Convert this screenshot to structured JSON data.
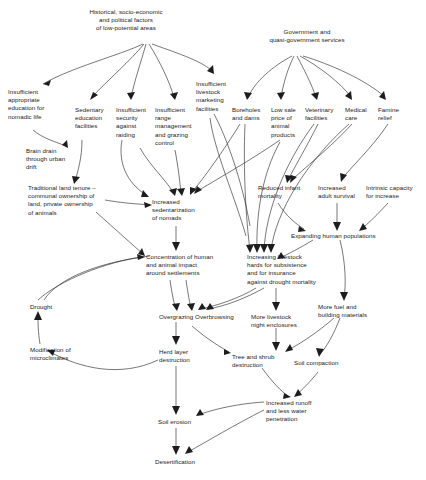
{
  "diagram": {
    "type": "flowchart",
    "stroke_color": "#1d1d1d",
    "text_color": "#1a1a1a",
    "background": "#ffffff",
    "nodes": [
      {
        "id": "historical",
        "label": "Historical, socio-economic\nand political factors\nof low-potential areas",
        "x": 70,
        "y": 8,
        "w": 112,
        "align": "center"
      },
      {
        "id": "government",
        "label": "Government and\nquasi-government services",
        "x": 252,
        "y": 28,
        "w": 110,
        "align": "center"
      },
      {
        "id": "education",
        "label": "Insufficient\nappropriate\neducation for\nnomadic life",
        "x": 8,
        "y": 88,
        "w": 52,
        "align": "left"
      },
      {
        "id": "sedentary-ed",
        "label": "Sedentary\neducation\nfacilities",
        "x": 75,
        "y": 106,
        "w": 40,
        "align": "left"
      },
      {
        "id": "security",
        "label": "Insufficient\nsecurity\nagainst\nraiding",
        "x": 116,
        "y": 106,
        "w": 38,
        "align": "left"
      },
      {
        "id": "range-mgmt",
        "label": "Insufficient\nrange\nmanagement\nand grazing\ncontrol",
        "x": 155,
        "y": 106,
        "w": 44,
        "align": "left"
      },
      {
        "id": "marketing",
        "label": "Insufficient\nlivestock\nmarketing\nfacilities",
        "x": 196,
        "y": 80,
        "w": 38,
        "align": "left"
      },
      {
        "id": "boreholes",
        "label": "Boreholes\nand dams",
        "x": 232,
        "y": 106,
        "w": 36,
        "align": "left"
      },
      {
        "id": "low-sale",
        "label": "Low sale\nprice of\nanimal\nproducts",
        "x": 271,
        "y": 106,
        "w": 32,
        "align": "left"
      },
      {
        "id": "veterinary",
        "label": "Veterinary\nfacilities",
        "x": 305,
        "y": 106,
        "w": 36,
        "align": "left"
      },
      {
        "id": "medical",
        "label": "Medical\ncare",
        "x": 345,
        "y": 106,
        "w": 30,
        "align": "left"
      },
      {
        "id": "famine",
        "label": "Famine\nrelief",
        "x": 378,
        "y": 106,
        "w": 28,
        "align": "left"
      },
      {
        "id": "brain-drain",
        "label": "Brain drain\nthrough urban\ndrift",
        "x": 26,
        "y": 147,
        "w": 52,
        "align": "left"
      },
      {
        "id": "land-tenure",
        "label": "Traditional land tenure –\ncommunal ownership of\nland, private ownership\nof animals",
        "x": 28,
        "y": 184,
        "w": 82,
        "align": "left"
      },
      {
        "id": "sedentarization",
        "label": "Increased\nsedentarization\nof nomads",
        "x": 152,
        "y": 198,
        "w": 52,
        "align": "left"
      },
      {
        "id": "reduced-infant",
        "label": "Reduced infant\nmortality",
        "x": 258,
        "y": 184,
        "w": 52,
        "align": "left"
      },
      {
        "id": "adult-survival",
        "label": "Increased\nadult survival",
        "x": 318,
        "y": 184,
        "w": 48,
        "align": "left"
      },
      {
        "id": "intrinsic",
        "label": "Intrinsic capacity\nfor increase",
        "x": 366,
        "y": 184,
        "w": 56,
        "align": "left"
      },
      {
        "id": "expanding-pop",
        "label": "Expanding human populations",
        "x": 291,
        "y": 232,
        "w": 100,
        "align": "left"
      },
      {
        "id": "concentration",
        "label": "Concentration of human\nand animal impact\naround settlements",
        "x": 146,
        "y": 253,
        "w": 86,
        "align": "left"
      },
      {
        "id": "livestock-herds",
        "label": "Increasing livestock\nhards for subsistence\nand for insurance\nagainst drought mortality",
        "x": 247,
        "y": 253,
        "w": 80,
        "align": "left"
      },
      {
        "id": "drought",
        "label": "Drought",
        "x": 30,
        "y": 303,
        "w": 32,
        "align": "left"
      },
      {
        "id": "overgrazing",
        "label": "Overgrazing Overbrowsing",
        "x": 159,
        "y": 313,
        "w": 90,
        "align": "left"
      },
      {
        "id": "night-enclosures",
        "label": "More livestock\nnight enclosures",
        "x": 251,
        "y": 313,
        "w": 56,
        "align": "left"
      },
      {
        "id": "fuel-building",
        "label": "More fuel and\nbuilding materials",
        "x": 318,
        "y": 303,
        "w": 58,
        "align": "left"
      },
      {
        "id": "microclimates",
        "label": "Modification of\nmicroclimates",
        "x": 30,
        "y": 346,
        "w": 52,
        "align": "left"
      },
      {
        "id": "herb-layer",
        "label": "Herd layer\ndestruction",
        "x": 159,
        "y": 348,
        "w": 42,
        "align": "left"
      },
      {
        "id": "tree-shrub",
        "label": "Tree and shrub\ndestruction",
        "x": 232,
        "y": 353,
        "w": 50,
        "align": "left"
      },
      {
        "id": "soil-compaction",
        "label": "Soil compaction",
        "x": 294,
        "y": 359,
        "w": 56,
        "align": "left"
      },
      {
        "id": "increased-runoff",
        "label": "Increased runoff\nand less water\npenetration",
        "x": 266,
        "y": 399,
        "w": 56,
        "align": "left"
      },
      {
        "id": "soil-erosion",
        "label": "Soil erosion",
        "x": 158,
        "y": 418,
        "w": 44,
        "align": "left"
      },
      {
        "id": "desertification",
        "label": "Desertification",
        "x": 155,
        "y": 458,
        "w": 52,
        "align": "left"
      }
    ],
    "edges": [
      {
        "from": "historical",
        "to": "education"
      },
      {
        "from": "historical",
        "to": "sedentary-ed"
      },
      {
        "from": "historical",
        "to": "security"
      },
      {
        "from": "historical",
        "to": "range-mgmt"
      },
      {
        "from": "historical",
        "to": "marketing"
      },
      {
        "from": "government",
        "to": "boreholes"
      },
      {
        "from": "government",
        "to": "low-sale"
      },
      {
        "from": "government",
        "to": "veterinary"
      },
      {
        "from": "government",
        "to": "medical"
      },
      {
        "from": "government",
        "to": "famine"
      },
      {
        "from": "education",
        "to": "brain-drain"
      },
      {
        "from": "sedentary-ed",
        "to": "sedentarization"
      },
      {
        "from": "security",
        "to": "sedentarization"
      },
      {
        "from": "range-mgmt",
        "to": "sedentarization"
      },
      {
        "from": "boreholes",
        "to": "sedentarization"
      },
      {
        "from": "land-tenure",
        "to": "sedentarization"
      },
      {
        "from": "sedentarization",
        "to": "concentration"
      },
      {
        "from": "land-tenure",
        "to": "concentration"
      },
      {
        "from": "drought",
        "to": "concentration"
      },
      {
        "from": "veterinary",
        "to": "reduced-infant"
      },
      {
        "from": "medical",
        "to": "reduced-infant"
      },
      {
        "from": "famine",
        "to": "adult-survival"
      },
      {
        "from": "reduced-infant",
        "to": "expanding-pop"
      },
      {
        "from": "adult-survival",
        "to": "expanding-pop"
      },
      {
        "from": "intrinsic",
        "to": "expanding-pop"
      },
      {
        "from": "expanding-pop",
        "to": "livestock-herds"
      },
      {
        "from": "boreholes",
        "to": "livestock-herds"
      },
      {
        "from": "low-sale",
        "to": "livestock-herds"
      },
      {
        "from": "veterinary",
        "to": "livestock-herds"
      },
      {
        "from": "medical",
        "to": "livestock-herds"
      },
      {
        "from": "marketing",
        "to": "livestock-herds"
      },
      {
        "from": "concentration",
        "to": "overgrazing"
      },
      {
        "from": "livestock-herds",
        "to": "overgrazing"
      },
      {
        "from": "livestock-herds",
        "to": "night-enclosures"
      },
      {
        "from": "expanding-pop",
        "to": "fuel-building"
      },
      {
        "from": "overgrazing",
        "to": "herb-layer"
      },
      {
        "from": "overgrazing",
        "to": "tree-shrub"
      },
      {
        "from": "night-enclosures",
        "to": "tree-shrub"
      },
      {
        "from": "fuel-building",
        "to": "tree-shrub"
      },
      {
        "from": "fuel-building",
        "to": "soil-compaction"
      },
      {
        "from": "tree-shrub",
        "to": "increased-runoff"
      },
      {
        "from": "soil-compaction",
        "to": "increased-runoff"
      },
      {
        "from": "herb-layer",
        "to": "soil-erosion"
      },
      {
        "from": "increased-runoff",
        "to": "soil-erosion"
      },
      {
        "from": "soil-erosion",
        "to": "desertification"
      },
      {
        "from": "increased-runoff",
        "to": "desertification"
      },
      {
        "from": "herb-layer",
        "to": "microclimates"
      },
      {
        "from": "microclimates",
        "to": "drought"
      }
    ]
  }
}
